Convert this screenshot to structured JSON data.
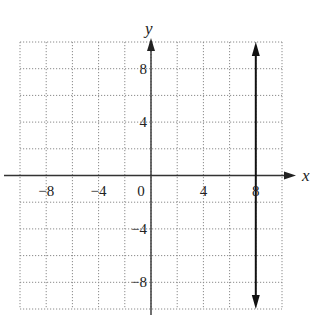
{
  "chart_data": {
    "type": "line",
    "title": "",
    "xlabel": "x",
    "ylabel": "y",
    "xlim": [
      -10,
      10
    ],
    "ylim": [
      -10,
      10
    ],
    "grid": true,
    "grid_step": 2,
    "xticks": [
      -8,
      -4,
      0,
      4,
      8
    ],
    "yticks": [
      -8,
      -4,
      4,
      8
    ],
    "xtick_labels": [
      "−8",
      "−4",
      "0",
      "4",
      "8"
    ],
    "ytick_labels": [
      "−8",
      "−4",
      "4",
      "8"
    ],
    "series": [
      {
        "name": "x = 8",
        "kind": "vertical-line",
        "x": [
          8,
          8
        ],
        "y": [
          -10,
          10
        ],
        "arrows": "both",
        "color": "#111111"
      }
    ],
    "legend": null
  }
}
